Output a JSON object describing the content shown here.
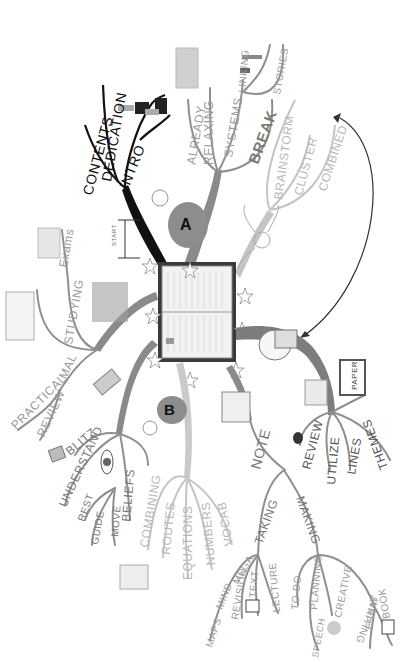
{
  "mindmap": {
    "center": {
      "label": "open-book",
      "marker_label": "START"
    },
    "branches": [
      {
        "id": "intro",
        "color": "#111111",
        "children": [
          "CONTENTS",
          "DEDICATION",
          "INTRO"
        ]
      },
      {
        "id": "A",
        "badge": "A",
        "color": "#8a8a8a",
        "children": [
          "ALREADY",
          "RELAXING",
          "SYSTEMS",
          "BREAK"
        ],
        "sub": {
          "parent": "SYSTEMS",
          "children": [
            "LINKING",
            "STORIES"
          ]
        }
      },
      {
        "id": "brainstorm",
        "color": "#c0c0c0",
        "children": [
          "BRAINSTORM",
          "CLUSTER",
          "COMBINED"
        ]
      },
      {
        "id": "paper",
        "color": "#7a7a7a",
        "box_label": "PAPER",
        "children": [
          "REVIEW",
          "UTILIZE",
          "LINES",
          "THEMES"
        ]
      },
      {
        "id": "note",
        "color": "#8a8a8a",
        "main": "NOTE",
        "taking": {
          "label": "TAKING",
          "children": [
            "MEGA",
            "MIND",
            "MAPS",
            "REVISION",
            "TEXT",
            "LECTURE"
          ]
        },
        "making": {
          "label": "MAKING",
          "children": [
            "TO-DO",
            "PLANNING",
            "SPEECH",
            "CREATIVE",
            "WRITING",
            "ESSAY",
            "BOOK"
          ]
        }
      },
      {
        "id": "B",
        "badge": "B",
        "color": "#c8c8c8",
        "children": [
          "COMBINING",
          "ROUTES",
          "EQUATIONS",
          "NUMBERS",
          "VOCAB"
        ]
      },
      {
        "id": "beliefs",
        "color": "#8a8a8a",
        "children": [
          "BLITZ",
          "UNDERSTAND",
          "BELIEFS"
        ],
        "sub": {
          "parent": "BELIEFS",
          "children": [
            "REST",
            "GUIDE",
            "MOVE"
          ]
        }
      },
      {
        "id": "studying",
        "color": "#8a8a8a",
        "children": [
          "STUDYING",
          "Exams",
          "MAL",
          "REVIEW",
          "PRACTICAL"
        ]
      }
    ],
    "connector_arrow": {
      "from": "COMBINED",
      "to": "paper-branch"
    }
  }
}
